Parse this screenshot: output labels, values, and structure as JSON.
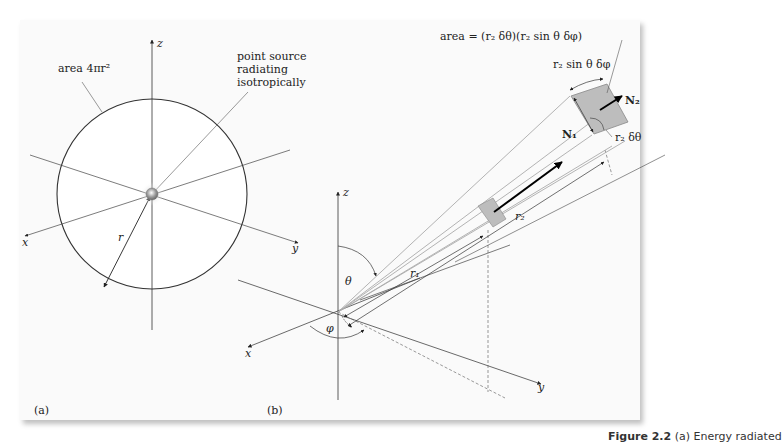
{
  "figure": {
    "caption_label": "Figure 2.2",
    "caption_text": "(a) Energy radiated"
  },
  "panel_a": {
    "label": "(a)",
    "area_label": "area 4πr²",
    "source_label_lines": [
      "point source",
      "radiating",
      "isotropically"
    ],
    "axes": {
      "x": "x",
      "y": "y",
      "z": "z"
    },
    "radius_label": "r"
  },
  "panel_b": {
    "label": "(b)",
    "area_formula": "area = (r₂ δθ)(r₂ sin θ δφ)",
    "arc_label": "r₂ sin θ δφ",
    "side_label": "r₂ δθ",
    "normal_1": "N₁",
    "normal_2": "N₂",
    "r1_label": "r₁",
    "r2_label": "r₂",
    "theta_label": "θ",
    "phi_label": "φ",
    "axes": {
      "x": "x",
      "y": "y",
      "z": "z"
    }
  }
}
